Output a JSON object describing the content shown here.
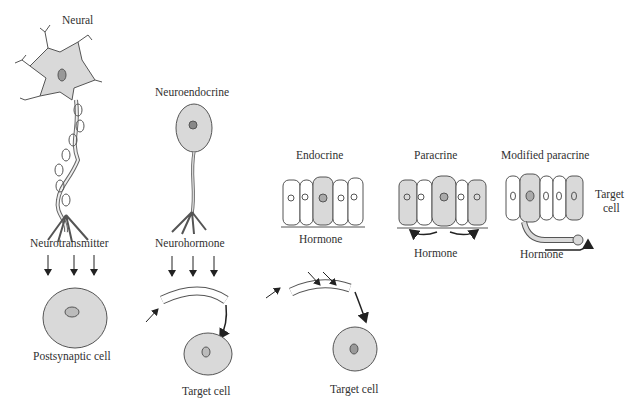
{
  "diagram": {
    "type": "signaling-modes",
    "colors": {
      "cell_fill": "#d9d9d9",
      "outline": "#555555",
      "arrow": "#222222",
      "background": "#ffffff"
    },
    "panels": [
      {
        "id": "neural",
        "title": "Neural",
        "signal_label": "Neurotransmitter",
        "target_label": "Postsynaptic cell"
      },
      {
        "id": "neuroendocrine",
        "title": "Neuroendocrine",
        "signal_label": "Neurohormone",
        "target_label": "Target cell"
      },
      {
        "id": "endocrine",
        "title": "Endocrine",
        "signal_label": "Hormone",
        "target_label": "Target cell"
      },
      {
        "id": "paracrine",
        "title": "Paracrine",
        "signal_label": "Hormone"
      },
      {
        "id": "modified-paracrine",
        "title": "Modified paracrine",
        "signal_label": "Hormone",
        "target_label_line1": "Target",
        "target_label_line2": "cell"
      }
    ]
  }
}
